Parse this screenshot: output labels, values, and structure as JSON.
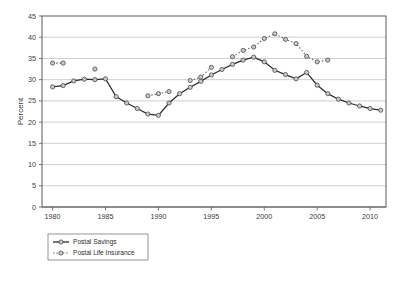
{
  "chart_data": {
    "type": "line",
    "title": "",
    "xlabel": "",
    "ylabel": "Percent",
    "xlim": [
      1979,
      2011.5
    ],
    "ylim": [
      0,
      45
    ],
    "yticks": [
      0,
      5,
      10,
      15,
      20,
      25,
      30,
      35,
      40,
      45
    ],
    "xticks": [
      1980,
      1985,
      1990,
      1995,
      2000,
      2005,
      2010
    ],
    "grid": "horizontal",
    "legend_position": "below-left",
    "series": [
      {
        "name": "Postal Savings",
        "style": "solid",
        "color": "#2b2b2b",
        "x": [
          1980,
          1981,
          1982,
          1983,
          1984,
          1985,
          1986,
          1987,
          1988,
          1989,
          1990,
          1991,
          1992,
          1993,
          1994,
          1995,
          1996,
          1997,
          1998,
          1999,
          2000,
          2001,
          2002,
          2003,
          2004,
          2005,
          2006,
          2007,
          2008,
          2009,
          2010,
          2011
        ],
        "values": [
          28.3,
          28.6,
          29.7,
          30.1,
          30.0,
          30.2,
          26.0,
          24.5,
          23.2,
          21.9,
          21.6,
          24.5,
          26.7,
          28.2,
          29.6,
          31.1,
          32.4,
          33.6,
          34.6,
          35.3,
          34.2,
          32.2,
          31.2,
          30.2,
          31.7,
          28.7,
          26.7,
          25.4,
          24.5,
          23.8,
          23.2,
          22.8
        ]
      },
      {
        "name": "Postal Life Insurance",
        "style": "dotted",
        "color": "#6e6e6e",
        "x": [
          1980,
          1981,
          1984,
          1989,
          1990,
          1991,
          1993,
          1994,
          1995,
          1997,
          1998,
          1999,
          2000,
          2001,
          2002,
          2003,
          2004,
          2005,
          2006
        ],
        "values": [
          33.9,
          33.9,
          32.5,
          26.2,
          26.7,
          27.2,
          29.8,
          30.6,
          32.9,
          35.4,
          36.9,
          37.7,
          39.7,
          40.8,
          39.5,
          38.5,
          35.5,
          34.2,
          34.6
        ]
      }
    ]
  },
  "axis": {
    "y_title": "Percent",
    "y_tick_labels": [
      "0",
      "5",
      "10",
      "15",
      "20",
      "25",
      "30",
      "35",
      "40",
      "45"
    ],
    "x_tick_labels": [
      "1980",
      "1985",
      "1990",
      "1995",
      "2000",
      "2005",
      "2010"
    ]
  },
  "legend": {
    "entries": [
      {
        "label": "Postal Savings",
        "style": "solid"
      },
      {
        "label": "Postal Life Insurance",
        "style": "dotted"
      }
    ]
  },
  "colors": {
    "savings_line": "#2b2b2b",
    "pli_line": "#6e6e6e",
    "marker_fill": "#c9c9c9",
    "marker_stroke": "#4a4a4a",
    "gridline": "#b9b9b9",
    "frame": "#5a5a5a",
    "background": "#ffffff"
  }
}
